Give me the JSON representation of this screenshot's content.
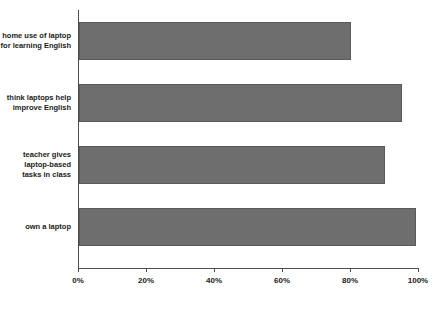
{
  "chart_data": {
    "type": "bar",
    "orientation": "horizontal",
    "title": "",
    "xlabel": "",
    "ylabel": "",
    "xlim": [
      0,
      100
    ],
    "grid": false,
    "legend": null,
    "bar_color": "#6e6e6e",
    "axis_color": "#4d4d4d",
    "categories": [
      "home use of laptop\nfor learning English",
      "think laptops help\nimprove English",
      "teacher gives\nlaptop-based\ntasks in class",
      "own a laptop"
    ],
    "values": [
      80,
      95,
      90,
      99
    ],
    "tick_labels": [
      "0%",
      "20%",
      "40%",
      "60%",
      "80%",
      "100%"
    ],
    "tick_values": [
      0,
      20,
      40,
      60,
      80,
      100
    ]
  }
}
